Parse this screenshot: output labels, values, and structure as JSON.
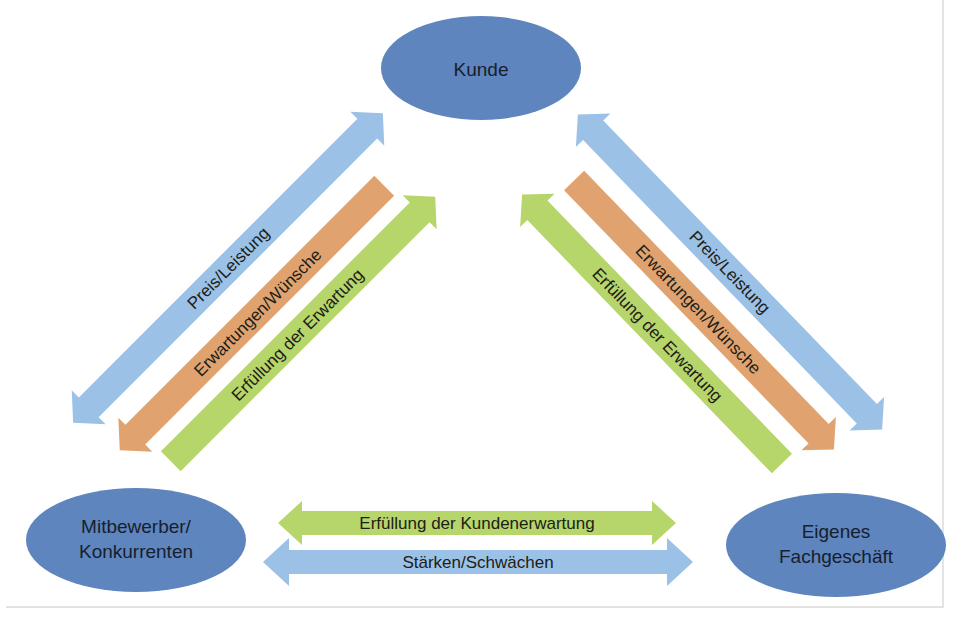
{
  "colors": {
    "node_fill": "#5e85bd",
    "blue_arrow": "#9bc2e6",
    "orange_arrow": "#e0a36f",
    "green_arrow": "#b6d56b",
    "text": "#16202e"
  },
  "nodes": {
    "kunde": {
      "label": "Kunde"
    },
    "mitbewerber": {
      "line1": "Mitbewerber/",
      "line2": "Konkurrenten"
    },
    "eigenes": {
      "line1": "Eigenes",
      "line2": "Fachgeschäft"
    }
  },
  "arrows": {
    "left": {
      "preis": {
        "label": "Preis/Leistung",
        "direction": "both"
      },
      "erwartungen": {
        "label": "Erwartungen/Wünsche",
        "direction": "to-mitbewerber"
      },
      "erfuellung": {
        "label": "Erfüllung der Erwartung",
        "direction": "to-kunde"
      }
    },
    "right": {
      "preis": {
        "label": "Preis/Leistung",
        "direction": "both"
      },
      "erwartungen": {
        "label": "Erwartungen/Wünsche",
        "direction": "to-eigenes"
      },
      "erfuellung": {
        "label": "Erfüllung der Erwartung",
        "direction": "to-kunde"
      }
    },
    "bottom": {
      "kundenerwartung": {
        "label": "Erfüllung der Kundenerwartung",
        "direction": "both"
      },
      "staerken": {
        "label": "Stärken/Schwächen",
        "direction": "both"
      }
    }
  }
}
